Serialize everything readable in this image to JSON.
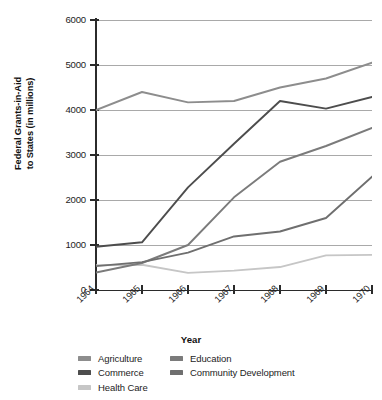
{
  "chart_data": {
    "type": "line",
    "title": "",
    "xlabel": "Year",
    "ylabel": "Federal Grants-in-Aid\nto States (in millions)",
    "categories": [
      "1964",
      "1965",
      "1966",
      "1967",
      "1968",
      "1969",
      "1970"
    ],
    "x": [
      1964,
      1965,
      1966,
      1967,
      1968,
      1969,
      1970
    ],
    "ylim": [
      0,
      6000
    ],
    "yticks": [
      0,
      1000,
      2000,
      3000,
      4000,
      5000,
      6000
    ],
    "ytick_labels": [
      "0",
      "1000",
      "2000",
      "3000",
      "4000",
      "5000",
      "6000"
    ],
    "grid": "horizontal",
    "legend_position": "bottom",
    "series": [
      {
        "name": "Agriculture",
        "color": "#8d8d8d",
        "values": [
          4000,
          4400,
          4170,
          4200,
          4500,
          4700,
          5050
        ]
      },
      {
        "name": "Commerce",
        "color": "#4d4d4d",
        "values": [
          960,
          1060,
          2280,
          3250,
          4200,
          4030,
          4290
        ]
      },
      {
        "name": "Health Care",
        "color": "#c6c6c6",
        "values": [
          550,
          560,
          380,
          430,
          510,
          770,
          780
        ]
      },
      {
        "name": "Education",
        "color": "#7b7b7b",
        "values": [
          390,
          600,
          1000,
          2060,
          2850,
          3200,
          3600
        ]
      },
      {
        "name": "Community Development",
        "color": "#6f6f6f",
        "values": [
          530,
          620,
          830,
          1190,
          1300,
          1600,
          2520
        ]
      }
    ]
  },
  "axes": {
    "y_title": "Federal Grants-in-Aid\nto States (in millions)",
    "x_title": "Year"
  },
  "legend": {
    "columns": [
      {
        "items": [
          "Agriculture",
          "Commerce",
          "Health Care"
        ]
      },
      {
        "items": [
          "Education",
          "Community Development"
        ]
      }
    ]
  },
  "colors": {
    "axis": "#2b2b2b",
    "grid": "#a9a9a9",
    "background": "#ffffff",
    "text": "#1d1d1d"
  }
}
